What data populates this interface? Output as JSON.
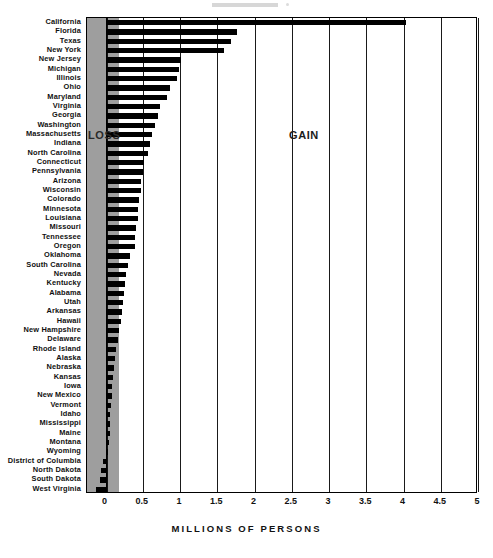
{
  "chart_data": {
    "type": "bar",
    "orientation": "horizontal",
    "title": "",
    "xlabel": "MILLIONS OF PERSONS",
    "ylabel": "",
    "xlim": [
      -0.25,
      5
    ],
    "xticks": [
      "0",
      "0.5",
      "1",
      "1.5",
      "2",
      "2.5",
      "3",
      "3.5",
      "4",
      "4.5",
      "5"
    ],
    "xtick_values": [
      0,
      0.5,
      1,
      1.5,
      2,
      2.5,
      3,
      3.5,
      4,
      4.5,
      5
    ],
    "grid": "vertical",
    "legend": "none",
    "annotations": [
      {
        "text": "LOSS",
        "region": "left-of-zero"
      },
      {
        "text": "GAIN",
        "region": "right-of-zero"
      }
    ],
    "categories": [
      "California",
      "Florida",
      "Texas",
      "New York",
      "New Jersey",
      "Michigan",
      "Illinois",
      "Ohio",
      "Maryland",
      "Virginia",
      "Georgia",
      "Washington",
      "Massachusetts",
      "Indiana",
      "North Carolina",
      "Connecticut",
      "Pennsylvania",
      "Arizona",
      "Wisconsin",
      "Colorado",
      "Minnesota",
      "Louisiana",
      "Missouri",
      "Tennessee",
      "Oregon",
      "Oklahoma",
      "South Carolina",
      "Nevada",
      "Kentucky",
      "Alabama",
      "Utah",
      "Arkansas",
      "Hawaii",
      "New Hampshire",
      "Delaware",
      "Rhode Island",
      "Alaska",
      "Nebraska",
      "Kansas",
      "Iowa",
      "New Mexico",
      "Vermont",
      "Idaho",
      "Mississippi",
      "Maine",
      "Montana",
      "Wyoming",
      "District of Columbia",
      "North Dakota",
      "South Dakota",
      "West Virginia"
    ],
    "values": [
      4.03,
      1.76,
      1.69,
      1.59,
      1.01,
      0.98,
      0.96,
      0.86,
      0.82,
      0.73,
      0.71,
      0.66,
      0.62,
      0.59,
      0.57,
      0.51,
      0.5,
      0.48,
      0.47,
      0.45,
      0.44,
      0.43,
      0.41,
      0.4,
      0.39,
      0.33,
      0.3,
      0.27,
      0.26,
      0.25,
      0.23,
      0.22,
      0.2,
      0.18,
      0.16,
      0.14,
      0.12,
      0.11,
      0.1,
      0.09,
      0.08,
      0.07,
      0.065,
      0.06,
      0.055,
      0.05,
      0.03,
      -0.04,
      -0.06,
      -0.08,
      -0.13
    ]
  },
  "axis": {
    "x_title": "MILLIONS OF PERSONS"
  },
  "notes": {
    "loss": "LOSS",
    "gain": "GAIN"
  }
}
